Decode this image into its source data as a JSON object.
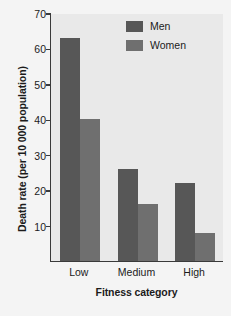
{
  "chart_data": {
    "type": "bar",
    "title": "",
    "subtitle": "",
    "xlabel": "Fitness category",
    "ylabel": "Death rate (per 10 000 population)",
    "categories": [
      "Low",
      "Medium",
      "High"
    ],
    "series": [
      {
        "name": "Men",
        "values": [
          63,
          26,
          22
        ],
        "color": "#575757"
      },
      {
        "name": "Women",
        "values": [
          40,
          16,
          8
        ],
        "color": "#6f6f6f"
      }
    ],
    "ylim": [
      0,
      70
    ],
    "ytick_values": [
      70,
      60,
      50,
      40,
      30,
      20,
      10
    ],
    "ytick_labels": [
      "70",
      "60",
      "50",
      "40",
      "30",
      "20",
      "10"
    ],
    "grid": false,
    "legend_position": "top-right",
    "legend_entries": [
      "Men",
      "Women"
    ],
    "plot_background": "#e9e9e9",
    "figure_background": "#f4f4f4",
    "axis_color": "#3a3a3a"
  }
}
